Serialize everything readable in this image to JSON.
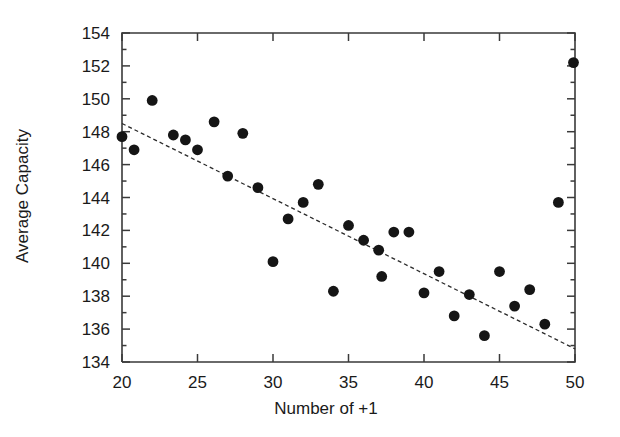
{
  "chart_data": {
    "type": "scatter",
    "title": "",
    "xlabel": "Number of +1",
    "ylabel": "Average Capacity",
    "xlim": [
      20,
      50
    ],
    "ylim": [
      134,
      154
    ],
    "xticks": [
      20,
      25,
      30,
      35,
      40,
      45,
      50
    ],
    "xtick_labels": [
      "20",
      "25",
      "30",
      "35",
      "40",
      "45",
      "50"
    ],
    "yticks": [
      134,
      136,
      138,
      140,
      142,
      144,
      146,
      148,
      150,
      152,
      154
    ],
    "ytick_labels": [
      "134",
      "136",
      "138",
      "140",
      "142",
      "144",
      "146",
      "148",
      "150",
      "152",
      "154"
    ],
    "xminor_step": 1,
    "yminor_step": 1,
    "grid": false,
    "legend": false,
    "marker": "filled-circle",
    "marker_color": "#151515",
    "points": [
      {
        "x": 20.0,
        "y": 147.7
      },
      {
        "x": 20.8,
        "y": 146.9
      },
      {
        "x": 22.0,
        "y": 149.9
      },
      {
        "x": 23.4,
        "y": 147.8
      },
      {
        "x": 24.2,
        "y": 147.5
      },
      {
        "x": 25.0,
        "y": 146.9
      },
      {
        "x": 26.1,
        "y": 148.6
      },
      {
        "x": 27.0,
        "y": 145.3
      },
      {
        "x": 28.0,
        "y": 147.9
      },
      {
        "x": 29.0,
        "y": 144.6
      },
      {
        "x": 30.0,
        "y": 140.1
      },
      {
        "x": 31.0,
        "y": 142.7
      },
      {
        "x": 32.0,
        "y": 143.7
      },
      {
        "x": 33.0,
        "y": 144.8
      },
      {
        "x": 34.0,
        "y": 138.3
      },
      {
        "x": 35.0,
        "y": 142.3
      },
      {
        "x": 36.0,
        "y": 141.4
      },
      {
        "x": 37.0,
        "y": 140.8
      },
      {
        "x": 37.2,
        "y": 139.2
      },
      {
        "x": 38.0,
        "y": 141.9
      },
      {
        "x": 39.0,
        "y": 141.9
      },
      {
        "x": 40.0,
        "y": 138.2
      },
      {
        "x": 41.0,
        "y": 139.5
      },
      {
        "x": 42.0,
        "y": 136.8
      },
      {
        "x": 43.0,
        "y": 138.1
      },
      {
        "x": 44.0,
        "y": 135.6
      },
      {
        "x": 45.0,
        "y": 139.5
      },
      {
        "x": 46.0,
        "y": 137.4
      },
      {
        "x": 47.0,
        "y": 138.4
      },
      {
        "x": 48.0,
        "y": 136.3
      },
      {
        "x": 48.9,
        "y": 143.7
      },
      {
        "x": 49.9,
        "y": 152.2
      }
    ],
    "trend_line": {
      "style": "dashed",
      "x_start": 20.0,
      "y_start": 148.5,
      "x_end": 50.0,
      "y_end": 134.8
    }
  }
}
